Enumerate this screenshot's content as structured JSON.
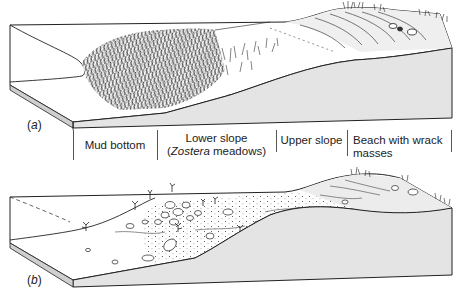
{
  "figure": {
    "panels": [
      {
        "id": "a",
        "label": "a",
        "zones": [
          {
            "name": "Mud bottom",
            "line1": "Mud bottom",
            "line2": ""
          },
          {
            "name": "Lower slope (Zostera meadows)",
            "line1": "Lower slope",
            "line2_prefix": "(",
            "line2_italic": "Zostera",
            "line2_suffix": " meadows)"
          },
          {
            "name": "Upper slope",
            "line1": "Upper slope",
            "line2": ""
          },
          {
            "name": "Beach with wrack masses",
            "line1": "Beach with wrack",
            "line2": "masses"
          }
        ]
      },
      {
        "id": "b",
        "label": "b"
      }
    ],
    "colors": {
      "line": "#222222",
      "face_fill": "#e4e4e4",
      "slab_edge": "#cfcfcf",
      "top_fill": "#ffffff",
      "beach_fill": "#ececec"
    }
  }
}
